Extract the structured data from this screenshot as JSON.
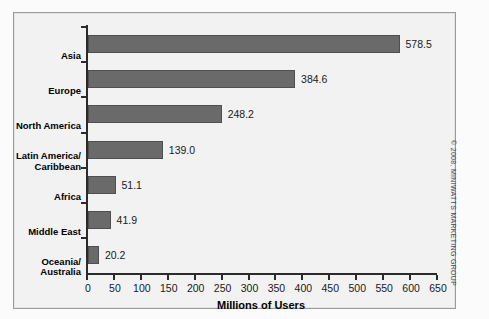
{
  "chart_data": {
    "type": "bar",
    "orientation": "horizontal",
    "title": "",
    "xlabel": "Millions of Users",
    "ylabel": "",
    "xlim": [
      0,
      650
    ],
    "grid": false,
    "legend": null,
    "categories": [
      "Asia",
      "Europe",
      "North America",
      "Latin America/ Caribbean",
      "Africa",
      "Middle East",
      "Oceania/ Australia"
    ],
    "category_lines": [
      [
        "Asia"
      ],
      [
        "Europe"
      ],
      [
        "North America"
      ],
      [
        "Latin America/",
        "Caribbean"
      ],
      [
        "Africa"
      ],
      [
        "Middle East"
      ],
      [
        "Oceania/",
        "Australia"
      ]
    ],
    "values": [
      578.5,
      384.6,
      248.2,
      139.0,
      51.1,
      41.9,
      20.2
    ],
    "value_labels": [
      "578.5",
      "384.6",
      "248.2",
      "139.0",
      "51.1",
      "41.9",
      "20.2"
    ],
    "x_ticks": [
      0,
      50,
      100,
      150,
      200,
      250,
      300,
      350,
      400,
      450,
      500,
      550,
      600,
      650
    ],
    "x_tick_labels": [
      "0",
      "50",
      "100",
      "150",
      "200",
      "250",
      "300",
      "350",
      "400",
      "450",
      "500",
      "550",
      "600",
      "650"
    ],
    "bar_color": "#6a6a6a",
    "axis_color": "#2b2b2b",
    "plot_background": "#f2f2f2"
  },
  "footer": {
    "copyright": "© 2008, MINIWATTS MARKETING GROUP"
  }
}
